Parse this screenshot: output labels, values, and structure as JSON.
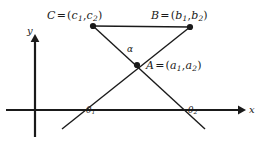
{
  "figure": {
    "background_color": "#ffffff",
    "ink_color": "#1a1a1a"
  },
  "axes": {
    "x_label": "x",
    "y_label": "y",
    "origin_px": [
      35,
      110
    ],
    "x_axis_from_px": [
      6,
      110
    ],
    "x_axis_to_px": [
      243,
      110
    ],
    "y_axis_from_px": [
      35,
      136
    ],
    "y_axis_to_px": [
      35,
      38
    ]
  },
  "points": [
    {
      "name": "C",
      "label_text": "C",
      "equals": "=",
      "open": "(",
      "coord1": "c",
      "sub1": "1",
      "comma": ",",
      "coord2": "c",
      "sub2": "2",
      "close": ")",
      "px": [
        93,
        26
      ]
    },
    {
      "name": "B",
      "label_text": "B",
      "equals": "=",
      "open": "(",
      "coord1": "b",
      "sub1": "1",
      "comma": ",",
      "coord2": "b",
      "sub2": "2",
      "close": ")",
      "px": [
        190,
        27
      ]
    },
    {
      "name": "A",
      "label_text": "A",
      "equals": "=",
      "open": "(",
      "coord1": "a",
      "sub1": "1",
      "comma": ",",
      "coord2": "a",
      "sub2": "2",
      "close": ")",
      "px": [
        137,
        65
      ]
    }
  ],
  "angles": [
    {
      "name": "alpha",
      "glyph": "α",
      "px": [
        132,
        52
      ]
    },
    {
      "name": "theta1",
      "glyph": "θ",
      "sub": "1",
      "px": [
        92,
        110
      ]
    },
    {
      "name": "theta2",
      "glyph": "θ",
      "sub": "2",
      "px": [
        186,
        110
      ]
    }
  ],
  "segments": [
    {
      "name": "segment-CB",
      "from_px": [
        93,
        26
      ],
      "to_px": [
        190,
        27
      ]
    },
    {
      "name": "line-C-through-A",
      "from_px": [
        93,
        26
      ],
      "to_px": [
        205,
        129
      ]
    },
    {
      "name": "line-B-through-A",
      "from_px": [
        190,
        27
      ],
      "to_px": [
        62,
        129
      ]
    }
  ]
}
